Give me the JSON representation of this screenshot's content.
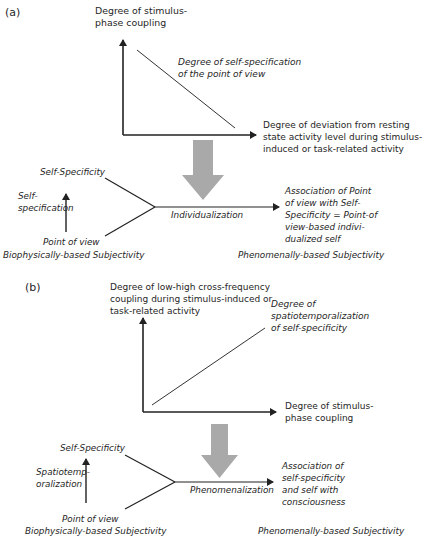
{
  "panel_a": {
    "label": "(a)",
    "chart": {
      "y_axis_label": "Degree of stimulus-\nphase coupling",
      "line_label": "Degree of self-specification\nof the point of view",
      "x_axis_label": "Degree of deviation from resting\nstate activity level during stimulus-\ninduced or task-related activity",
      "trend": "decreasing"
    },
    "flow": {
      "top_node": "Self-Specificity",
      "arrow_label": "Self-\nspecification",
      "bottom_node": "Point of view",
      "process_label": "Individualization",
      "result": "Association of Point\nof view with Self-\nSpecificity = Point-of\nview-based indivi-\ndualized self",
      "left_caption": "Biophysically-based Subjectivity",
      "right_caption": "Phenomenally-based Subjectivity"
    }
  },
  "panel_b": {
    "label": "(b)",
    "chart": {
      "y_axis_label": "Degree of low-high cross-frequency\ncoupling during stimulus-induced or\ntask-related activity",
      "line_label": "Degree of\nspatiotemporalization\nof self-specificity",
      "x_axis_label": "Degree of stimulus-\nphase coupling",
      "trend": "increasing"
    },
    "flow": {
      "top_node": "Self-Specificity",
      "arrow_label": "Spatiotemp-\noralization",
      "bottom_node": "Point of view",
      "process_label": "Phenomenalization",
      "result": "Association of\nself-specificity\nand self with\nconsciousness",
      "left_caption": "Biophysically-based Subjectivity",
      "right_caption": "Phenomenally-based Subjectivity"
    }
  },
  "colors": {
    "line": "#222222",
    "gray_arrow": "#a9a9a9",
    "text": "#262626"
  }
}
